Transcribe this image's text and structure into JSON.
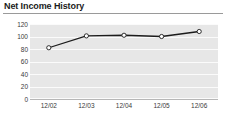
{
  "header": {
    "title": "Net Income History"
  },
  "chart_data": {
    "type": "line",
    "title": "Net Income History",
    "xlabel": "",
    "ylabel": "",
    "categories": [
      "12/02",
      "12/03",
      "12/04",
      "12/05",
      "12/06"
    ],
    "values": [
      82,
      101,
      102,
      100,
      108
    ],
    "series": [
      {
        "name": "Net Income",
        "values": [
          82,
          101,
          102,
          100,
          108
        ]
      }
    ],
    "yticks": [
      0,
      20,
      40,
      60,
      80,
      100,
      120
    ],
    "ytick_labels": [
      "0",
      "20",
      "40",
      "60",
      "80",
      "100",
      "120"
    ],
    "ylim": [
      0,
      120
    ],
    "grid": true,
    "legend": false,
    "legend_position": "none",
    "marker": "open-circle",
    "colors": {
      "line": "#1c1c1c",
      "marker_fill": "#ffffff",
      "marker_edge": "#1c1c1c",
      "plot_background": "#e7e7e7",
      "gridline": "#fbfbfb",
      "axis": "#b6b6b6",
      "title_text": "#1b1b1b",
      "tick_text": "#3a3a3a",
      "page_background": "#ffffff"
    }
  }
}
